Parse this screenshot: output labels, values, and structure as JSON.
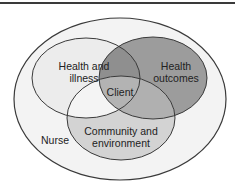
{
  "diagram": {
    "type": "venn",
    "outer": {
      "label": "Nurse",
      "fill": "#f3f3f3"
    },
    "sets": [
      {
        "id": "health_illness",
        "label_line1": "Health and",
        "label_line2": "illness",
        "fill": "#ececec"
      },
      {
        "id": "health_outcomes",
        "label_line1": "Health",
        "label_line2": "outcomes",
        "fill": "#9c9c9c"
      },
      {
        "id": "community_environment",
        "label_line1": "Community and",
        "label_line2": "environment",
        "fill": "#d3d3d3"
      }
    ],
    "center": {
      "label": "Client",
      "fill": "#b3b3b3"
    },
    "overlap_top_fill": "#8f8f8f",
    "overlap_right_fill": "#b0b0b0",
    "overlap_left_fill": "#f4f4f4",
    "stroke": "#3a3a3a"
  }
}
